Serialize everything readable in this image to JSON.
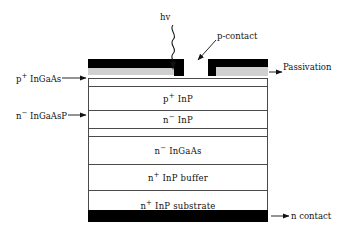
{
  "diagram": {
    "colors": {
      "contact_metal": "#000000",
      "passivation": "#d0d0d0",
      "layer_outline": "#4a4a4a",
      "background": "#ffffff",
      "text": "#111111"
    }
  },
  "layers": [
    {
      "id": "p-inp",
      "label_main": "p",
      "label_sup": "+",
      "label_rest": " InP"
    },
    {
      "id": "n-inp",
      "label_main": "n",
      "label_sup": "−",
      "label_rest": " InP"
    },
    {
      "id": "n-ingaas",
      "label_main": "n",
      "label_sup": "−",
      "label_rest": " InGaAs"
    },
    {
      "id": "n-inp-buffer",
      "label_main": "n",
      "label_sup": "+",
      "label_rest": " InP buffer"
    },
    {
      "id": "n-inp-substrate",
      "label_main": "n",
      "label_sup": "+",
      "label_rest": " InP substrate"
    }
  ],
  "callouts": {
    "hv": "hv",
    "p_contact": "p-contact",
    "passivation": "Passivation",
    "n_contact": "n contact",
    "p_ingaas_main": "p",
    "p_ingaas_sup": "+",
    "p_ingaas_rest": " InGaAs",
    "n_ingaasp_main": "n",
    "n_ingaasp_sup": "−",
    "n_ingaasp_rest": " InGaAsP"
  },
  "icons": {
    "photon_wave": "wavy-arrow-icon",
    "arrow_left": "arrow-left-icon",
    "arrow_right": "arrow-right-icon",
    "arrow_diagonal": "arrow-diagonal-icon"
  }
}
